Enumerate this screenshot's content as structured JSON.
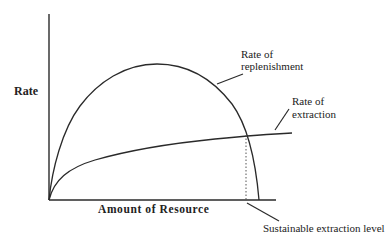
{
  "diagram": {
    "type": "economic resource diagram",
    "y_axis_label": "Rate",
    "x_axis_label": "Amount of Resource",
    "curves": {
      "replenishment": {
        "label_line1": "Rate of",
        "label_line2": "replenishment",
        "shape": "inverted parabola / arch"
      },
      "extraction": {
        "label_line1": "Rate of",
        "label_line2": "extraction",
        "shape": "concave increasing (logarithmic-like)"
      }
    },
    "annotation": {
      "label": "Sustainable extraction level",
      "marker": "dotted vertical line at intersection of curves"
    },
    "colors": {
      "line": "#2a2a2a",
      "text": "#222222",
      "background": "#ffffff"
    }
  }
}
